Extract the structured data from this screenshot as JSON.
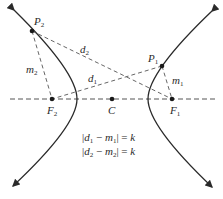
{
  "figure": {
    "points": {
      "P1": {
        "label": "P",
        "sub": "1"
      },
      "P2": {
        "label": "P",
        "sub": "2"
      },
      "F1": {
        "label": "F",
        "sub": "1"
      },
      "F2": {
        "label": "F",
        "sub": "2"
      },
      "C": {
        "label": "C"
      }
    },
    "segments": {
      "d1": {
        "label": "d",
        "sub": "1"
      },
      "d2": {
        "label": "d",
        "sub": "2"
      },
      "m1": {
        "label": "m",
        "sub": "1"
      },
      "m2": {
        "label": "m",
        "sub": "2"
      }
    },
    "equations": [
      {
        "a": "d",
        "asub": "1",
        "b": "m",
        "bsub": "1",
        "rhs": "k"
      },
      {
        "a": "d",
        "asub": "2",
        "b": "m",
        "bsub": "2",
        "rhs": "k"
      }
    ],
    "colors": {
      "curve": "#2a2a2a",
      "dash": "#555555",
      "point": "#1a1a1a"
    }
  }
}
